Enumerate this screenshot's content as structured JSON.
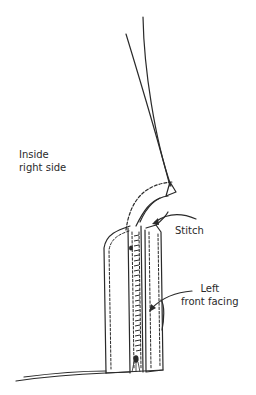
{
  "diagram": {
    "type": "sewing-instruction-illustration",
    "ink_color": "#2a2a2a",
    "background": "#ffffff",
    "labels": {
      "inside_right_side": {
        "line1": "Inside",
        "line2": "right side"
      },
      "stitch": "Stitch",
      "left_front_facing": {
        "line1": "Left",
        "line2": "front facing"
      }
    },
    "parts": [
      "neckline-edges",
      "collar-fold-triangle",
      "dashed-stitch-curve",
      "left-panel-outline",
      "zipper-teeth",
      "zipper-pull",
      "facing-panel-outline",
      "hem-line",
      "stitch-arrow",
      "facing-arrow"
    ]
  }
}
